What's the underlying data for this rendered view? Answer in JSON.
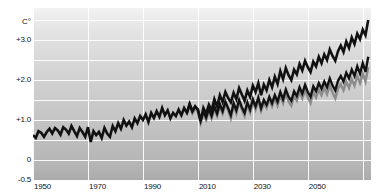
{
  "chart_data": {
    "type": "line",
    "title": "",
    "subtitle": "",
    "xlabel": "",
    "ylabel": "C°",
    "unit_label": "C°",
    "xlim": [
      1950,
      2073
    ],
    "ylim": [
      -0.5,
      3.8
    ],
    "grid": true,
    "grid_x_step": 20,
    "grid_y_step": 0.5,
    "legend_position": "none",
    "x_ticks": [
      {
        "label": "1950",
        "value": 1950
      },
      {
        "label": "1970",
        "value": 1970
      },
      {
        "label": "1990",
        "value": 1990
      },
      {
        "label": "2010",
        "value": 2010
      },
      {
        "label": "2030",
        "value": 2030
      },
      {
        "label": "2050",
        "value": 2050
      }
    ],
    "y_ticks": [
      {
        "label": "+3.0",
        "value": 3.0
      },
      {
        "label": "+2.0",
        "value": 2.0
      },
      {
        "label": "+1.0",
        "value": 1.0
      },
      {
        "label": "0",
        "value": 0.0
      },
      {
        "label": "-0.5",
        "value": -0.5
      }
    ],
    "colors": {
      "line_high": "#111111",
      "line_mid": "#111111",
      "line_low": "#8c8c8c",
      "grid": "#ffffff",
      "plot_bg_top": "#f2f2f2",
      "plot_bg_bottom": "#ababab",
      "page_bg": "#ffffff",
      "text": "#111111"
    },
    "series": [
      {
        "name": "high-scenario",
        "color": "#111111",
        "x": [
          1950,
          1951,
          1952,
          1953,
          1954,
          1955,
          1956,
          1957,
          1958,
          1959,
          1960,
          1961,
          1962,
          1963,
          1964,
          1965,
          1966,
          1967,
          1968,
          1969,
          1970,
          1971,
          1972,
          1973,
          1974,
          1975,
          1976,
          1977,
          1978,
          1979,
          1980,
          1981,
          1982,
          1983,
          1984,
          1985,
          1986,
          1987,
          1988,
          1989,
          1990,
          1991,
          1992,
          1993,
          1994,
          1995,
          1996,
          1997,
          1998,
          1999,
          2000,
          2001,
          2002,
          2003,
          2004,
          2005,
          2006,
          2007,
          2008,
          2009,
          2010,
          2011,
          2012,
          2013,
          2014,
          2015,
          2016,
          2017,
          2018,
          2019,
          2020,
          2021,
          2022,
          2023,
          2024,
          2025,
          2026,
          2027,
          2028,
          2029,
          2030,
          2031,
          2032,
          2033,
          2034,
          2035,
          2036,
          2037,
          2038,
          2039,
          2040,
          2041,
          2042,
          2043,
          2044,
          2045,
          2046,
          2047,
          2048,
          2049,
          2050,
          2051,
          2052,
          2053,
          2054,
          2055,
          2056,
          2057,
          2058,
          2059,
          2060,
          2061,
          2062,
          2063,
          2064,
          2065,
          2066,
          2067,
          2068,
          2069,
          2070,
          2071,
          2072
        ],
        "values": [
          0.62,
          0.55,
          0.72,
          0.68,
          0.58,
          0.7,
          0.78,
          0.66,
          0.8,
          0.74,
          0.63,
          0.82,
          0.76,
          0.66,
          0.85,
          0.72,
          0.6,
          0.8,
          0.7,
          0.58,
          0.82,
          0.45,
          0.72,
          0.62,
          0.7,
          0.55,
          0.8,
          0.66,
          0.58,
          0.85,
          0.72,
          0.92,
          0.78,
          1.0,
          0.86,
          0.96,
          0.82,
          1.04,
          0.92,
          1.1,
          1.0,
          1.14,
          0.95,
          1.18,
          1.05,
          1.22,
          1.08,
          1.3,
          1.12,
          1.24,
          1.04,
          1.18,
          1.1,
          1.26,
          1.12,
          1.3,
          1.18,
          1.4,
          1.22,
          1.34,
          1.26,
          0.98,
          1.3,
          1.16,
          1.38,
          1.24,
          1.52,
          1.34,
          1.62,
          1.45,
          1.7,
          1.55,
          1.44,
          1.68,
          1.52,
          1.8,
          1.64,
          1.48,
          1.74,
          1.58,
          1.86,
          1.7,
          1.92,
          1.62,
          1.88,
          1.74,
          2.0,
          1.82,
          2.08,
          1.9,
          2.22,
          2.02,
          2.3,
          2.12,
          2.0,
          2.26,
          2.14,
          2.4,
          2.24,
          2.48,
          2.32,
          2.2,
          2.46,
          2.34,
          2.58,
          2.42,
          2.64,
          2.5,
          2.76,
          2.6,
          2.48,
          2.72,
          2.86,
          2.7,
          2.96,
          2.8,
          3.06,
          2.9,
          3.16,
          3.02,
          3.26,
          3.12,
          3.5
        ]
      },
      {
        "name": "mid-scenario",
        "color": "#111111",
        "x": [
          2006,
          2007,
          2008,
          2009,
          2010,
          2011,
          2012,
          2013,
          2014,
          2015,
          2016,
          2017,
          2018,
          2019,
          2020,
          2021,
          2022,
          2023,
          2024,
          2025,
          2026,
          2027,
          2028,
          2029,
          2030,
          2031,
          2032,
          2033,
          2034,
          2035,
          2036,
          2037,
          2038,
          2039,
          2040,
          2041,
          2042,
          2043,
          2044,
          2045,
          2046,
          2047,
          2048,
          2049,
          2050,
          2051,
          2052,
          2053,
          2054,
          2055,
          2056,
          2057,
          2058,
          2059,
          2060,
          2061,
          2062,
          2063,
          2064,
          2065,
          2066,
          2067,
          2068,
          2069,
          2070,
          2071,
          2072
        ],
        "values": [
          1.18,
          1.4,
          1.22,
          1.34,
          1.26,
          0.98,
          1.22,
          1.06,
          1.28,
          1.1,
          1.34,
          1.16,
          1.4,
          1.22,
          1.46,
          1.3,
          1.12,
          1.42,
          1.24,
          1.5,
          1.32,
          1.18,
          1.44,
          1.26,
          1.52,
          1.34,
          1.56,
          1.3,
          1.5,
          1.38,
          1.58,
          1.42,
          1.62,
          1.46,
          1.7,
          1.52,
          1.76,
          1.58,
          1.48,
          1.72,
          1.6,
          1.82,
          1.66,
          1.88,
          1.7,
          1.58,
          1.84,
          1.72,
          1.92,
          1.78,
          1.96,
          1.82,
          2.04,
          1.86,
          1.74,
          1.98,
          2.1,
          1.96,
          2.18,
          2.04,
          2.26,
          2.1,
          2.34,
          2.16,
          2.42,
          2.2,
          2.58
        ]
      },
      {
        "name": "low-scenario",
        "color": "#8c8c8c",
        "x": [
          2006,
          2007,
          2008,
          2009,
          2010,
          2011,
          2012,
          2013,
          2014,
          2015,
          2016,
          2017,
          2018,
          2019,
          2020,
          2021,
          2022,
          2023,
          2024,
          2025,
          2026,
          2027,
          2028,
          2029,
          2030,
          2031,
          2032,
          2033,
          2034,
          2035,
          2036,
          2037,
          2038,
          2039,
          2040,
          2041,
          2042,
          2043,
          2044,
          2045,
          2046,
          2047,
          2048,
          2049,
          2050,
          2051,
          2052,
          2053,
          2054,
          2055,
          2056,
          2057,
          2058,
          2059,
          2060,
          2061,
          2062,
          2063,
          2064,
          2065,
          2066,
          2067,
          2068,
          2069,
          2070,
          2071,
          2072
        ],
        "values": [
          1.14,
          1.34,
          1.16,
          1.28,
          1.2,
          0.92,
          1.16,
          1.0,
          1.22,
          1.04,
          1.28,
          1.1,
          1.34,
          1.16,
          1.4,
          1.24,
          1.04,
          1.36,
          1.16,
          1.44,
          1.26,
          1.1,
          1.38,
          1.18,
          1.46,
          1.26,
          1.48,
          1.22,
          1.42,
          1.3,
          1.5,
          1.34,
          1.54,
          1.36,
          1.6,
          1.42,
          1.66,
          1.46,
          1.36,
          1.6,
          1.48,
          1.7,
          1.54,
          1.74,
          1.56,
          1.42,
          1.7,
          1.56,
          1.76,
          1.62,
          1.8,
          1.64,
          1.86,
          1.68,
          1.54,
          1.78,
          1.9,
          1.74,
          1.96,
          1.8,
          2.02,
          1.86,
          2.1,
          1.92,
          2.16,
          1.96,
          2.32
        ]
      }
    ]
  }
}
